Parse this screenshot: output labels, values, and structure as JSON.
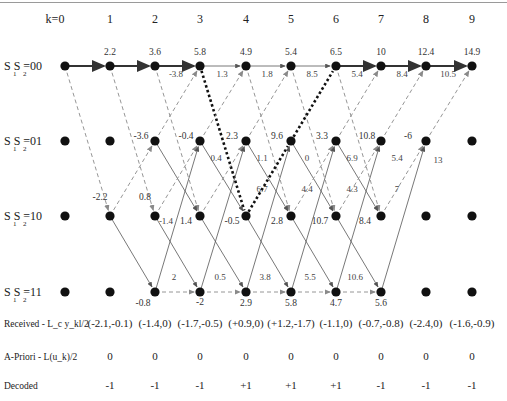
{
  "diagram": {
    "title": "",
    "stages": [
      "k=0",
      "1",
      "2",
      "3",
      "4",
      "5",
      "6",
      "7",
      "8",
      "9"
    ],
    "states": [
      {
        "id": "00",
        "label_main": "S S =00",
        "subs": [
          "1",
          "2"
        ]
      },
      {
        "id": "01",
        "label_main": "S S =01",
        "subs": [
          "1",
          "2"
        ]
      },
      {
        "id": "10",
        "label_main": "S S =10",
        "subs": [
          "1",
          "2"
        ]
      },
      {
        "id": "11",
        "label_main": "S S =11",
        "subs": [
          "1",
          "2"
        ]
      }
    ],
    "node_metrics": {
      "00": [
        "",
        "2.2",
        "3.6",
        "5.8",
        "4.9",
        "5.4",
        "6.5",
        "10",
        "12.4",
        "14.9"
      ],
      "01": [
        "",
        "",
        "-3.6",
        "-0.4",
        "2.3",
        "9.6",
        "3.3",
        "10.8",
        "-6",
        ""
      ],
      "10": [
        "",
        "-2.2",
        "0.8",
        "1.4",
        "-0.5",
        "2.8",
        "10.7",
        "8.4",
        "",
        ""
      ],
      "11": [
        "",
        "",
        "-0.8",
        "-2",
        "2.9",
        "5.8",
        "4.7",
        "5.6",
        "",
        ""
      ]
    },
    "branch_labels": [
      {
        "text": "-3.8",
        "k": 3,
        "near": "00-in"
      },
      {
        "text": "1.3",
        "k": 4,
        "near": "00-in"
      },
      {
        "text": "1.8",
        "k": 5,
        "near": "00-in"
      },
      {
        "text": "8.5",
        "k": 6,
        "near": "00-in"
      },
      {
        "text": "5.4",
        "k": 7,
        "near": "00-in"
      },
      {
        "text": "8.4",
        "k": 8,
        "near": "00-in"
      },
      {
        "text": "10.5",
        "k": 9,
        "near": "00-in"
      },
      {
        "text": "0.4",
        "k": 3,
        "near": "01-out"
      },
      {
        "text": "1.1",
        "k": 4,
        "near": "01-out"
      },
      {
        "text": "0",
        "k": 5,
        "near": "01-out"
      },
      {
        "text": "6.9",
        "k": 6,
        "near": "01-out"
      },
      {
        "text": "5.4",
        "k": 7,
        "near": "01-out"
      },
      {
        "text": "13",
        "k": 8,
        "near": "01-in"
      },
      {
        "text": "-1.4",
        "k": 3,
        "near": "10-below"
      },
      {
        "text": "6.7",
        "k": 4,
        "near": "10-in"
      },
      {
        "text": "4.4",
        "k": 5,
        "near": "10-in"
      },
      {
        "text": "4.3",
        "k": 6,
        "near": "10-in"
      },
      {
        "text": "7",
        "k": 7,
        "near": "10-in"
      },
      {
        "text": "2",
        "k": 3,
        "near": "11-in"
      },
      {
        "text": "0.5",
        "k": 4,
        "near": "11-in"
      },
      {
        "text": "3.8",
        "k": 5,
        "near": "11-in"
      },
      {
        "text": "5.5",
        "k": 6,
        "near": "11-in"
      },
      {
        "text": "10.6",
        "k": 7,
        "near": "11-in"
      }
    ],
    "legend": {
      "solid": "input +1 branch",
      "dashed": "input -1 branch",
      "thick_dotted": "highlighted path"
    },
    "rows": [
      {
        "label": "Received - L_c y_kl/2",
        "label_main": "Received  -  L",
        "label_rest": "y",
        "values": [
          "(-2.1,-0.1)",
          "(-1.4,0)",
          "(-1.7,-0.5)",
          "(+0.9,0)",
          "(+1.2,-1.7)",
          "(-1.1,0)",
          "(-0.7,-0.8)",
          "(-2.4,0)",
          "(-1.6,-0.9)"
        ]
      },
      {
        "label": "A-Priori - L(u_k)/2",
        "values": [
          "0",
          "0",
          "0",
          "0",
          "0",
          "0",
          "0",
          "0",
          "0"
        ]
      },
      {
        "label": "Decoded",
        "values": [
          "-1",
          "-1",
          "-1",
          "+1",
          "+1",
          "+1",
          "-1",
          "-1",
          "-1"
        ]
      }
    ],
    "colors": {
      "node": "#111111",
      "solid_line": "#555555",
      "dashed_line": "#8a8a8a",
      "survivor_line": "#333333",
      "highlight_dotted": "#111111",
      "frame_top": "#9a9a9a"
    }
  }
}
